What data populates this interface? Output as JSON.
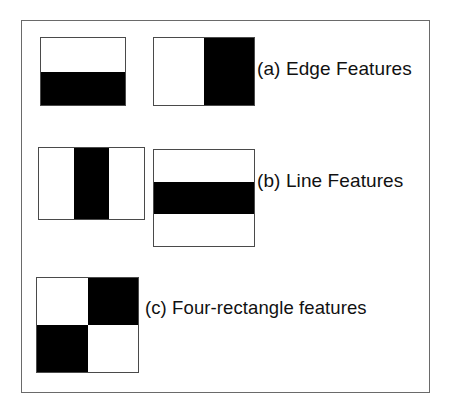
{
  "figure": {
    "frame": {
      "border_color": "#6a6a6a",
      "background_color": "#ffffff"
    },
    "colors": {
      "positive_region": "#ffffff",
      "negative_region": "#000000",
      "outline": "#4a4a4a",
      "text": "#111111"
    },
    "rows": [
      {
        "id": "a",
        "caption": "(a) Edge Features",
        "features": [
          {
            "name": "two-rectangle-horizontal-split",
            "orientation": "horizontal",
            "regions": 2,
            "pattern": "white-top-black-bottom"
          },
          {
            "name": "two-rectangle-vertical-split",
            "orientation": "vertical",
            "regions": 2,
            "pattern": "white-left-black-right"
          }
        ]
      },
      {
        "id": "b",
        "caption": "(b) Line Features",
        "features": [
          {
            "name": "three-rectangle-vertical-bands",
            "orientation": "vertical",
            "regions": 3,
            "pattern": "white-black-white"
          },
          {
            "name": "three-rectangle-horizontal-bands",
            "orientation": "horizontal",
            "regions": 3,
            "pattern": "white-black-white"
          }
        ]
      },
      {
        "id": "c",
        "caption": "(c) Four-rectangle features",
        "features": [
          {
            "name": "four-rectangle-checkerboard",
            "orientation": "diagonal",
            "regions": 4,
            "pattern": "white-black-black-white"
          }
        ]
      }
    ]
  }
}
